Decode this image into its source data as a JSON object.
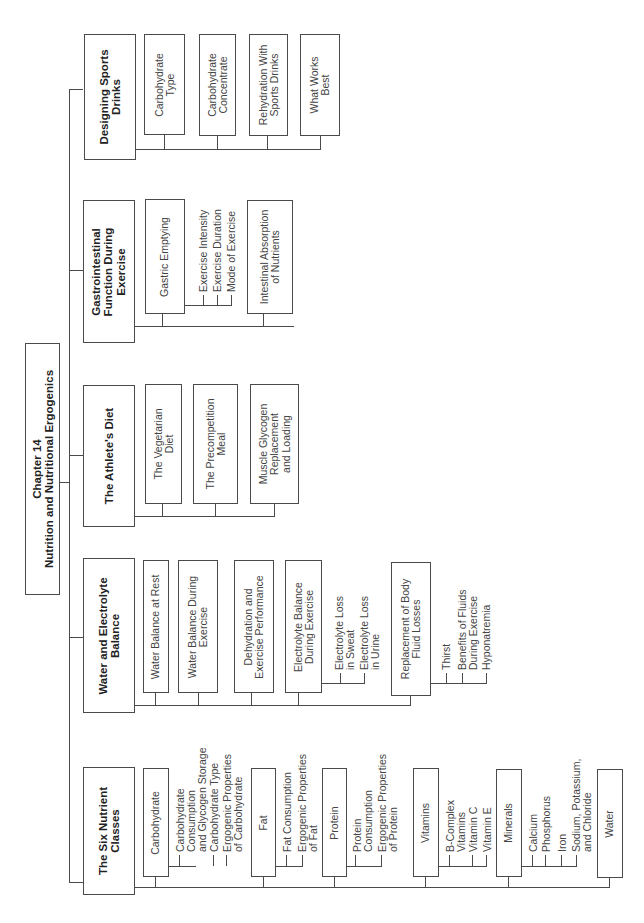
{
  "diagram": {
    "type": "hierarchy-tree",
    "orientation": "rotated-90-ccw",
    "root": {
      "title_line1": "Chapter 14",
      "title_line2": "Nutrition and Nutritional Ergogenics"
    },
    "sections": [
      {
        "title": "The Six Nutrient\nClasses",
        "children": [
          {
            "label": "Carbohydrate",
            "items": [
              "Carbohydrate\nConsumption\nand Glycogen Storage",
              "Carbohydrate Type",
              "Ergogenic Properties\nof Carbohydrate"
            ]
          },
          {
            "label": "Fat",
            "items": [
              "Fat Consumption",
              "Ergogenic Properties\nof Fat"
            ]
          },
          {
            "label": "Protein",
            "items": [
              "Protein\nConsumption",
              "Ergogenic Properties\nof Protein"
            ]
          },
          {
            "label": "Vitamins",
            "items": [
              "B-Complex\nVitamins",
              "Vitamin C",
              "Vitamin E"
            ]
          },
          {
            "label": "Minerals",
            "items": [
              "Calcium",
              "Phosphorus",
              "Iron",
              "Sodium, Potassium,\nand Chloride"
            ]
          },
          {
            "label": "Water",
            "items": []
          }
        ]
      },
      {
        "title": "Water and Electrolyte\nBalance",
        "children": [
          {
            "label": "Water Balance at Rest",
            "items": []
          },
          {
            "label": "Water Balance During\nExercise",
            "items": []
          },
          {
            "label": "Dehydration and\nExercise Performance",
            "items": []
          },
          {
            "label": "Electrolyte Balance\nDuring Exercise",
            "items": [
              "Electrolyte Loss\nin Sweat",
              "Electrolyte Loss\nin Urine"
            ]
          },
          {
            "label": "Replacement of Body\nFluid Losses",
            "items": [
              "Thirst",
              "Benefits of Fluids\nDuring Exercise",
              "Hyponatremia"
            ]
          }
        ]
      },
      {
        "title": "The Athlete's Diet",
        "children": [
          {
            "label": "The Vegetarian\nDiet",
            "items": []
          },
          {
            "label": "The Precompetition\nMeal",
            "items": []
          },
          {
            "label": "Muscle Glycogen\nReplacement\nand Loading",
            "items": []
          }
        ]
      },
      {
        "title": "Gastrointestinal\nFunction During\nExercise",
        "children": [
          {
            "label": "Gastric Emptying",
            "items": [
              "Exercise Intensity",
              "Exercise Duration",
              "Mode of Exercise"
            ]
          },
          {
            "label": "Intestinal Absorption\nof Nutrients",
            "items": []
          }
        ]
      },
      {
        "title": "Designing Sports\nDrinks",
        "children": [
          {
            "label": "Carbohydrate\nType",
            "items": []
          },
          {
            "label": "Carbohydrate\nConcentrate",
            "items": []
          },
          {
            "label": "Rehydration With\nSports Drinks",
            "items": []
          },
          {
            "label": "What Works\nBest",
            "items": []
          }
        ]
      }
    ]
  }
}
